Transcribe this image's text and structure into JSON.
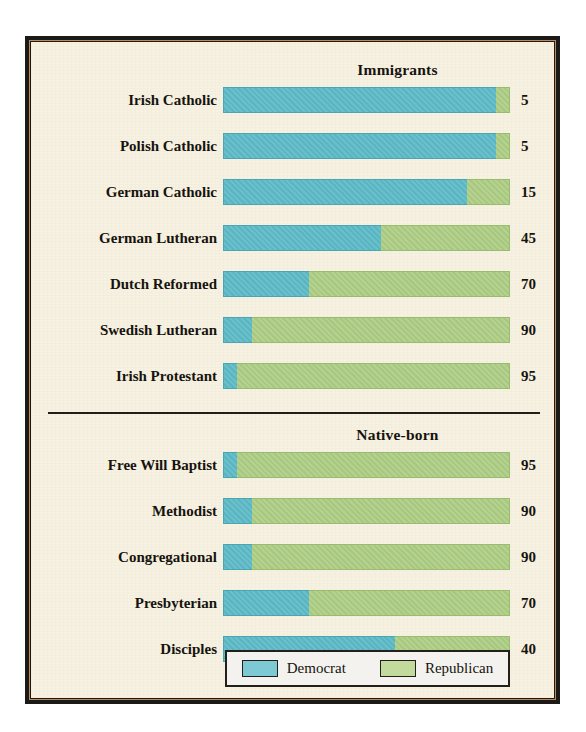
{
  "figure": {
    "background_color": "#f6f1e0",
    "frame_color": "#1b1a18",
    "accent_rule_color": "#c08a55"
  },
  "sections": [
    {
      "id": "immigrants",
      "title": "Immigrants"
    },
    {
      "id": "native-born",
      "title": "Native-born"
    }
  ],
  "legend": {
    "items": [
      {
        "label": "Democrat",
        "color": "#5cb9c6"
      },
      {
        "label": "Republican",
        "color": "#abcc82"
      }
    ]
  },
  "chart_data": {
    "type": "bar",
    "subtype": "stacked-horizontal-100pct",
    "title": "",
    "xlabel": "",
    "ylabel": "",
    "xlim": [
      0,
      100
    ],
    "grid": false,
    "legend_position": "bottom-center",
    "series": [
      {
        "name": "Democrat",
        "color": "#5cb9c6"
      },
      {
        "name": "Republican",
        "color": "#abcc82"
      }
    ],
    "panels": [
      {
        "name": "Immigrants",
        "categories": [
          "Irish Catholic",
          "Polish Catholic",
          "German Catholic",
          "German Lutheran",
          "Dutch Reformed",
          "Swedish Lutheran",
          "Irish Protestant"
        ],
        "democrat": [
          95,
          95,
          85,
          55,
          30,
          10,
          5
        ],
        "republican": [
          5,
          5,
          15,
          45,
          70,
          90,
          95
        ]
      },
      {
        "name": "Native-born",
        "categories": [
          "Free Will Baptist",
          "Methodist",
          "Congregational",
          "Presbyterian",
          "Disciples"
        ],
        "democrat": [
          5,
          10,
          10,
          30,
          60
        ],
        "republican": [
          95,
          90,
          90,
          70,
          40
        ]
      }
    ]
  }
}
